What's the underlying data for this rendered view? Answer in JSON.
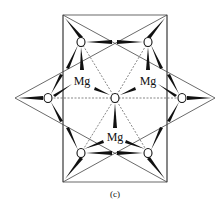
{
  "figure": {
    "caption": "(c)",
    "labels": {
      "mg_top_left": "Mg",
      "mg_top_right": "Mg",
      "mg_bottom": "Mg"
    },
    "atoms": {
      "oxygen_symbol": "O",
      "magnesium_symbol": "Mg"
    },
    "colors": {
      "line": "#333333",
      "bond": "#111111",
      "dashed": "#555555",
      "background": "#ffffff"
    }
  }
}
